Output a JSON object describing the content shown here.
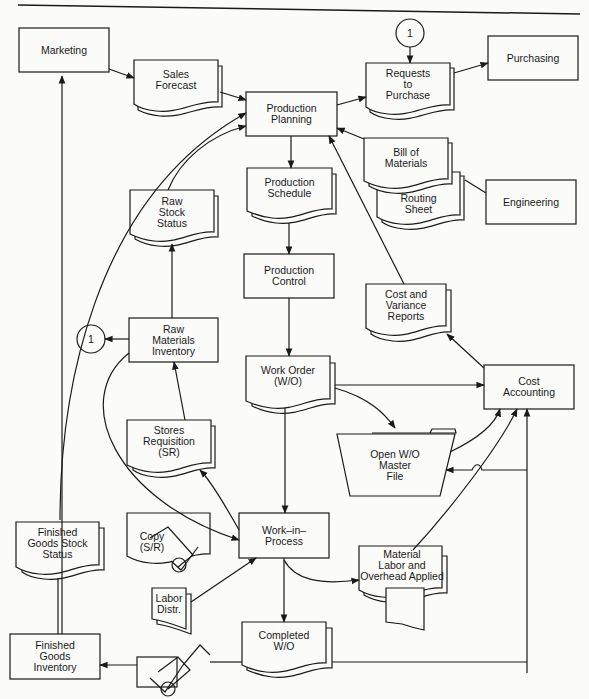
{
  "diagram": {
    "nodes": {
      "marketing": "Marketing",
      "sales_forecast": "Sales\nForecast",
      "production_planning": "Production\nPlanning",
      "requests_to_purchase": "Requests\nto\nPurchase",
      "purchasing": "Purchasing",
      "connector_top": "1",
      "bill_of_materials": "Bill of\nMaterials",
      "routing_sheet": "Routing\nSheet",
      "engineering": "Engineering",
      "raw_stock_status": "Raw\nStock\nStatus",
      "production_schedule": "Production\nSchedule",
      "production_control": "Production\nControl",
      "cost_variance_reports": "Cost and\nVariance\nReports",
      "raw_materials_inventory": "Raw\nMaterials\nInventory",
      "connector_left": "1",
      "work_order": "Work Order\n(W/O)",
      "cost_accounting": "Cost\nAccounting",
      "stores_requisition": "Stores\nRequisition\n(SR)",
      "open_wo_master_file": "Open  W/O\nMaster\nFile",
      "finished_goods_stock_status": "Finished\nGoods Stock\nStatus",
      "copy_sr": "Copy\n(S/R)",
      "work_in_process": "Work–in–\nProcess",
      "material_labor_overhead": "Material\nLabor and\nOverhead Applied",
      "labor_distr": "Labor\nDistr.",
      "finished_goods_inventory": "Finished\nGoods\nInventory",
      "completed_wo": "Completed\nW/O"
    }
  }
}
